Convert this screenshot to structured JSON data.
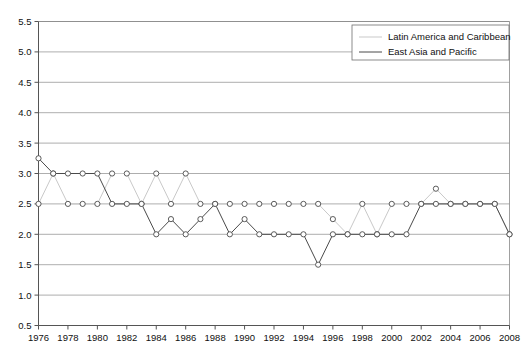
{
  "chart_data": {
    "type": "line",
    "title": "",
    "subtitle": "",
    "xlabel": "",
    "ylabel": "",
    "xlim": [
      1976,
      2008
    ],
    "ylim": [
      0.5,
      5.5
    ],
    "grid": true,
    "legend_position": "top-right",
    "x": [
      1976,
      1977,
      1978,
      1979,
      1980,
      1981,
      1982,
      1983,
      1984,
      1985,
      1986,
      1987,
      1988,
      1989,
      1990,
      1991,
      1992,
      1993,
      1994,
      1995,
      1996,
      1997,
      1998,
      1999,
      2000,
      2001,
      2002,
      2003,
      2004,
      2005,
      2006,
      2007,
      2008
    ],
    "xticks": [
      1976,
      1978,
      1980,
      1982,
      1984,
      1986,
      1988,
      1990,
      1992,
      1994,
      1996,
      1998,
      2000,
      2002,
      2004,
      2006,
      2008
    ],
    "yticks": [
      0.5,
      1.0,
      1.5,
      2.0,
      2.5,
      3.0,
      3.5,
      4.0,
      4.5,
      5.0,
      5.5
    ],
    "series": [
      {
        "name": "Latin America and Caribbean",
        "style": "dotted-light",
        "color": "#c9c9c9",
        "values": [
          2.5,
          3.0,
          2.5,
          2.5,
          2.5,
          3.0,
          3.0,
          2.5,
          3.0,
          2.5,
          3.0,
          2.5,
          2.5,
          2.5,
          2.5,
          2.5,
          2.5,
          2.5,
          2.5,
          2.5,
          2.25,
          2.0,
          2.5,
          2.0,
          2.5,
          2.5,
          2.5,
          2.75,
          2.5,
          2.5,
          2.5,
          2.5,
          2.0
        ]
      },
      {
        "name": "East Asia and Pacific",
        "style": "solid-dark",
        "color": "#4a4a4a",
        "values": [
          3.25,
          3.0,
          3.0,
          3.0,
          3.0,
          2.5,
          2.5,
          2.5,
          2.0,
          2.25,
          2.0,
          2.25,
          2.5,
          2.0,
          2.25,
          2.0,
          2.0,
          2.0,
          2.0,
          1.5,
          2.0,
          2.0,
          2.0,
          2.0,
          2.0,
          2.0,
          2.5,
          2.5,
          2.5,
          2.5,
          2.5,
          2.5,
          2.0
        ]
      }
    ]
  },
  "legend": {
    "entries": [
      {
        "label": "Latin America and Caribbean"
      },
      {
        "label": "East Asia and Pacific"
      }
    ]
  },
  "axes": {
    "y_labels": [
      "5.5",
      "5.0",
      "4.5",
      "4.0",
      "3.5",
      "3.0",
      "2.5",
      "2.0",
      "1.5",
      "1.0",
      "0.5"
    ],
    "x_labels": [
      "1976",
      "1978",
      "1980",
      "1982",
      "1984",
      "1986",
      "1988",
      "1990",
      "1992",
      "1994",
      "1996",
      "1998",
      "2000",
      "2002",
      "2004",
      "2006",
      "2008"
    ]
  }
}
